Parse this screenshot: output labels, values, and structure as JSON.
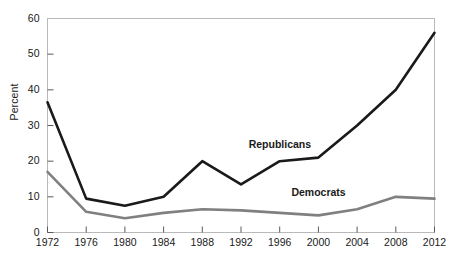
{
  "chart_data": {
    "type": "line",
    "title": "",
    "xlabel": "",
    "ylabel": "Percent",
    "categories": [
      "1972",
      "1976",
      "1980",
      "1984",
      "1988",
      "1992",
      "1996",
      "2000",
      "2004",
      "2008",
      "2012"
    ],
    "x": [
      1972,
      1976,
      1980,
      1984,
      1988,
      1992,
      1996,
      2000,
      2004,
      2008,
      2012
    ],
    "xlim": [
      1972,
      2012
    ],
    "ylim": [
      0,
      60
    ],
    "yticks": [
      0,
      10,
      20,
      30,
      40,
      50,
      60
    ],
    "ytick_labels": [
      "0",
      "10",
      "20",
      "30",
      "40",
      "50",
      "60"
    ],
    "grid": false,
    "legend_position": "inline-annotations",
    "series": [
      {
        "name": "Republicans",
        "color": "#1a1a1a",
        "values": [
          36.5,
          9.5,
          7.5,
          10.0,
          20.0,
          13.5,
          20.0,
          21.0,
          30.0,
          40.0,
          56.0
        ]
      },
      {
        "name": "Democrats",
        "color": "#808080",
        "values": [
          17.0,
          5.8,
          4.0,
          5.5,
          6.5,
          6.2,
          5.5,
          4.8,
          6.5,
          10.0,
          9.5
        ]
      }
    ],
    "annotations": [
      {
        "text": "Republicans",
        "x": 1996,
        "y": 24.5
      },
      {
        "text": "Democrats",
        "x": 2000,
        "y": 11.0
      }
    ]
  },
  "axes": {
    "y_axis_title": "Percent"
  }
}
